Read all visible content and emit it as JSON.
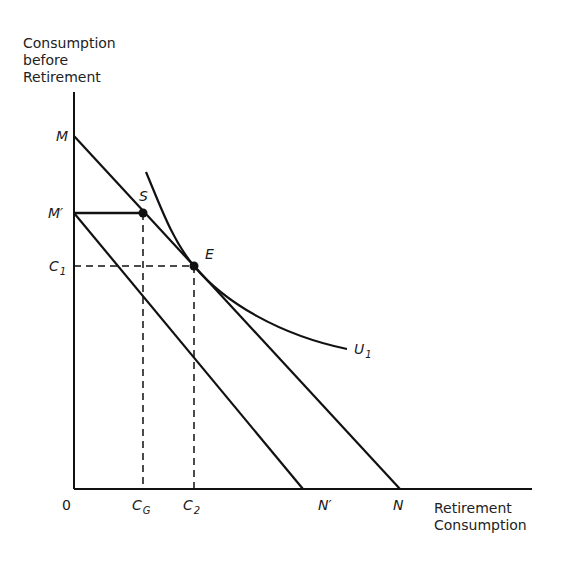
{
  "diagram": {
    "type": "consumption-saving budget constraint with forced saving",
    "y_axis_title": [
      "Consumption",
      "before",
      "Retirement"
    ],
    "x_axis_title": [
      "Retirement",
      "Consumption"
    ],
    "origin_label": "0",
    "points": {
      "M": "M",
      "M_prime": "M′",
      "S": "S",
      "E": "E",
      "N": "N",
      "N_prime": "N′",
      "C1_main": "C",
      "C1_sub": "1",
      "CG_main": "C",
      "CG_sub": "G",
      "C2_main": "C",
      "C2_sub": "2",
      "U1_main": "U",
      "U1_sub": "1"
    },
    "lines": [
      {
        "name": "budget-line-MN",
        "from": "M",
        "to": "N"
      },
      {
        "name": "budget-line-MprimeNprime",
        "from": "M′",
        "to": "N′"
      },
      {
        "name": "forced-saving-segment",
        "from": "M′",
        "to": "S"
      },
      {
        "name": "indifference-curve",
        "label": "U1",
        "tangent_at": "E"
      }
    ],
    "guides": [
      {
        "name": "C1-dashed-horizontal",
        "from": "C1",
        "to": "E"
      },
      {
        "name": "CG-dashed-vertical",
        "from": "S",
        "to": "CG"
      },
      {
        "name": "C2-dashed-vertical",
        "from": "E",
        "to": "C2"
      }
    ]
  }
}
